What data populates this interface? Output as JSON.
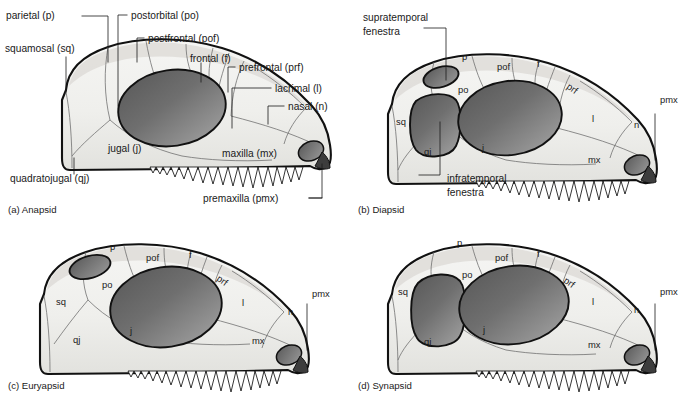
{
  "figure": {
    "background_color": "#ffffff",
    "line_color": "#1a1a1a",
    "bone_fill_light": "#f2f2f0",
    "bone_fill_shadow": "#d9d9d6",
    "opening_dark": "#4e4e4e",
    "opening_light": "#8e8e8e",
    "suture_color": "#6a6a6a"
  },
  "panels": [
    {
      "id": "a",
      "caption": "(a) Anapsid",
      "caption_x": 8,
      "caption_y": 210,
      "openings": [
        "orbit",
        "external naris"
      ],
      "callouts": [
        {
          "name": "parietal",
          "text": "parietal (p)",
          "x": 6,
          "y": 19
        },
        {
          "name": "squamosal",
          "text": "squamosal (sq)",
          "x": 5,
          "y": 52
        },
        {
          "name": "quadratojugal",
          "text": "quadratojugal (qj)",
          "x": 10,
          "y": 180
        },
        {
          "name": "postorbital",
          "text": "postorbital (po)",
          "x": 131,
          "y": 19
        },
        {
          "name": "postfrontal",
          "text": "postfrontal (pof)",
          "x": 148,
          "y": 42
        },
        {
          "name": "frontal",
          "text": "frontal (f)",
          "x": 188,
          "y": 60
        },
        {
          "name": "prefrontal",
          "text": "prefrontal (prf)",
          "x": 239,
          "y": 71
        },
        {
          "name": "lacrimal",
          "text": "lacrimal (l)",
          "x": 275,
          "y": 92
        },
        {
          "name": "nasal",
          "text": "nasal (n)",
          "x": 288,
          "y": 110
        },
        {
          "name": "jugal",
          "text": "jugal (j)",
          "x": 108,
          "y": 150
        },
        {
          "name": "maxilla",
          "text": "maxilla (mx)",
          "x": 222,
          "y": 155
        },
        {
          "name": "premaxilla",
          "text": "premaxilla (pmx)",
          "x": 232,
          "y": 202
        }
      ]
    },
    {
      "id": "b",
      "caption": "(b) Diapsid",
      "caption_x": 358,
      "caption_y": 210,
      "openings": [
        "supratemporal fenestra",
        "infratemporal fenestra",
        "orbit",
        "external naris"
      ],
      "callouts": [
        {
          "name": "supratemporal-fenestra",
          "text": "supratemporal",
          "x": 363,
          "y": 17
        },
        {
          "name": "supratemporal-fenestra-line2",
          "text": "fenestra",
          "x": 363,
          "y": 31
        },
        {
          "name": "infratemporal-fenestra",
          "text": "infratemporal",
          "x": 424,
          "y": 178
        },
        {
          "name": "infratemporal-fenestra-line2",
          "text": "fenestra",
          "x": 424,
          "y": 192
        }
      ],
      "inner_labels": [
        {
          "name": "parietal",
          "text": "p",
          "x": 462,
          "y": 57
        },
        {
          "name": "postfrontal",
          "text": "pof",
          "x": 497,
          "y": 67
        },
        {
          "name": "frontal",
          "text": "f",
          "x": 537,
          "y": 64
        },
        {
          "name": "prefrontal",
          "text": "prf",
          "x": 573,
          "y": 88,
          "rotate": 35
        },
        {
          "name": "postorbital",
          "text": "po",
          "x": 460,
          "y": 90
        },
        {
          "name": "squamosal",
          "text": "sq",
          "x": 398,
          "y": 122
        },
        {
          "name": "quadratojugal",
          "text": "qj",
          "x": 425,
          "y": 152
        },
        {
          "name": "jugal",
          "text": "j",
          "x": 482,
          "y": 148
        },
        {
          "name": "lacrimal",
          "text": "l",
          "x": 592,
          "y": 119
        },
        {
          "name": "nasal",
          "text": "n",
          "x": 634,
          "y": 125
        },
        {
          "name": "maxilla",
          "text": "mx",
          "x": 592,
          "y": 160
        },
        {
          "name": "premaxilla",
          "text": "pmx",
          "x": 660,
          "y": 100
        }
      ]
    },
    {
      "id": "c",
      "caption": "(c) Euryapsid",
      "caption_x": 8,
      "caption_y": 386,
      "openings": [
        "supratemporal fenestra",
        "orbit",
        "external naris"
      ],
      "callouts": [],
      "inner_labels": [
        {
          "name": "parietal",
          "text": "p",
          "x": 110,
          "y": 247
        },
        {
          "name": "postfrontal",
          "text": "pof",
          "x": 148,
          "y": 258
        },
        {
          "name": "frontal",
          "text": "f",
          "x": 189,
          "y": 255
        },
        {
          "name": "prefrontal",
          "text": "prf",
          "x": 224,
          "y": 279,
          "rotate": 35
        },
        {
          "name": "postorbital",
          "text": "po",
          "x": 104,
          "y": 285
        },
        {
          "name": "squamosal",
          "text": "sq",
          "x": 58,
          "y": 302
        },
        {
          "name": "quadratojugal",
          "text": "qj",
          "x": 75,
          "y": 340
        },
        {
          "name": "jugal",
          "text": "j",
          "x": 130,
          "y": 331
        },
        {
          "name": "lacrimal",
          "text": "l",
          "x": 242,
          "y": 303
        },
        {
          "name": "nasal",
          "text": "n",
          "x": 288,
          "y": 312
        },
        {
          "name": "maxilla",
          "text": "mx",
          "x": 256,
          "y": 341
        },
        {
          "name": "premaxilla",
          "text": "pmx",
          "x": 312,
          "y": 294
        }
      ]
    },
    {
      "id": "d",
      "caption": "(d) Synapsid",
      "caption_x": 358,
      "caption_y": 386,
      "openings": [
        "lateral temporal fenestra",
        "orbit",
        "external naris"
      ],
      "callouts": [],
      "inner_labels": [
        {
          "name": "parietal",
          "text": "p",
          "x": 457,
          "y": 243
        },
        {
          "name": "postfrontal",
          "text": "pof",
          "x": 497,
          "y": 258
        },
        {
          "name": "frontal",
          "text": "f",
          "x": 537,
          "y": 254
        },
        {
          "name": "prefrontal",
          "text": "prf",
          "x": 570,
          "y": 281,
          "rotate": 35
        },
        {
          "name": "postorbital",
          "text": "po",
          "x": 464,
          "y": 275
        },
        {
          "name": "squamosal",
          "text": "sq",
          "x": 400,
          "y": 292
        },
        {
          "name": "quadratojugal",
          "text": "qj",
          "x": 425,
          "y": 342
        },
        {
          "name": "jugal",
          "text": "j",
          "x": 483,
          "y": 330
        },
        {
          "name": "lacrimal",
          "text": "l",
          "x": 592,
          "y": 302
        },
        {
          "name": "nasal",
          "text": "n",
          "x": 634,
          "y": 310
        },
        {
          "name": "maxilla",
          "text": "mx",
          "x": 592,
          "y": 345
        },
        {
          "name": "premaxilla",
          "text": "pmx",
          "x": 660,
          "y": 292
        }
      ]
    }
  ]
}
